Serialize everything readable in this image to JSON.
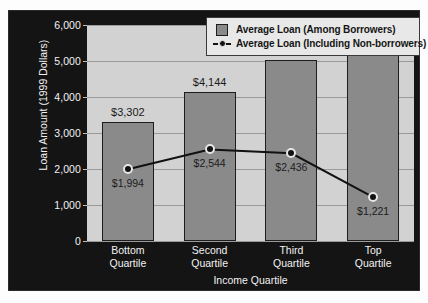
{
  "chart_data": {
    "type": "bar",
    "title": "",
    "xlabel": "Income Quartile",
    "ylabel": "Loan Amount (1999 Dollars)",
    "categories": [
      "Bottom Quartile",
      "Second Quartile",
      "Third Quartile",
      "Top Quartile"
    ],
    "category_lines": [
      [
        "Bottom",
        "Quartile"
      ],
      [
        "Second",
        "Quartile"
      ],
      [
        "Third",
        "Quartile"
      ],
      [
        "Top",
        "Quartile"
      ]
    ],
    "ylim": [
      0,
      6000
    ],
    "yticks": [
      0,
      1000,
      2000,
      3000,
      4000,
      5000,
      6000
    ],
    "ytick_labels": [
      "0",
      "1,000",
      "2,000",
      "3,000",
      "4,000",
      "5,000",
      "6,000"
    ],
    "grid": true,
    "legend_position": "top-right",
    "series": [
      {
        "name": "Average Loan (Among Borrowers)",
        "type": "bar",
        "values": [
          3302,
          4144,
          5028,
          5331
        ],
        "value_labels": [
          "$3,302",
          "$4,144",
          "$5,028",
          "$5,331"
        ],
        "color": "#8a8a8a"
      },
      {
        "name": "Average Loan (Including Non-borrowers)",
        "type": "line",
        "values": [
          1994,
          2544,
          2436,
          1221
        ],
        "value_labels": [
          "$1,994",
          "$2,544",
          "$2,436",
          "$1,221"
        ],
        "color": "#111111",
        "marker": "filled-circle"
      }
    ]
  },
  "legend": {
    "items": [
      {
        "label": "Average Loan (Among Borrowers)",
        "marker": "square-swatch"
      },
      {
        "label": "Average Loan (Including Non-borrowers)",
        "marker": "line-with-dot"
      }
    ]
  },
  "axes": {
    "y_title": "Loan Amount (1999 Dollars)",
    "x_title": "Income Quartile"
  },
  "colors": {
    "panel_background": "#141414",
    "plot_background": "#d2d2d2",
    "bar_fill": "#8a8a8a",
    "line": "#111111",
    "gridline": "#9a9a9a",
    "axis_text": "#f2f2f2",
    "data_label_text": "#1a1a1a",
    "legend_background": "#e8e8e8"
  }
}
